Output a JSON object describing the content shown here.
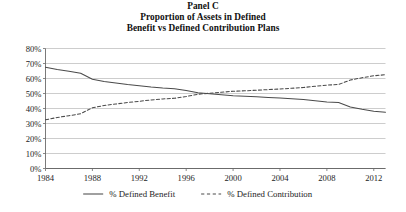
{
  "figure": {
    "panel_label": "Panel C",
    "title_line_1": "Proportion of Assets in Defined",
    "title_line_2": "Benefit vs Defined Contribution Plans"
  },
  "colors": {
    "line": "#4a4a4a",
    "grid": "#b8b8b8",
    "axis": "#6b6b6b",
    "text": "#1a1a1a",
    "background": "#ffffff"
  },
  "legend": {
    "position": "bottom",
    "entries": [
      {
        "label": "% Defined Benefit",
        "style": "solid"
      },
      {
        "label": "% Defined Contribution",
        "style": "dashed"
      }
    ]
  },
  "axes": {
    "y_ticks": [
      "0%",
      "10%",
      "20%",
      "30%",
      "40%",
      "50%",
      "60%",
      "70%",
      "80%"
    ],
    "x_ticks": [
      "1984",
      "1988",
      "1992",
      "1996",
      "2000",
      "2004",
      "2008",
      "2012"
    ]
  },
  "chart_data": {
    "type": "line",
    "xlabel": "",
    "ylabel": "",
    "xlim": [
      1984,
      2013
    ],
    "ylim": [
      0,
      80
    ],
    "grid": true,
    "legend_position": "bottom",
    "x": [
      1984,
      1985,
      1986,
      1987,
      1988,
      1989,
      1990,
      1991,
      1992,
      1993,
      1994,
      1995,
      1996,
      1997,
      1998,
      1999,
      2000,
      2001,
      2002,
      2003,
      2004,
      2005,
      2006,
      2007,
      2008,
      2009,
      2010,
      2011,
      2012,
      2013
    ],
    "series": [
      {
        "name": "% Defined Benefit",
        "style": "solid",
        "values": [
          67.5,
          66.0,
          64.8,
          63.5,
          59.5,
          58.0,
          57.0,
          56.0,
          55.2,
          54.3,
          53.6,
          53.2,
          52.0,
          50.5,
          49.8,
          49.2,
          48.5,
          48.2,
          47.8,
          47.4,
          47.0,
          46.5,
          46.0,
          45.2,
          44.4,
          44.0,
          41.0,
          39.5,
          38.2,
          37.5
        ]
      },
      {
        "name": "% Defined Contribution",
        "style": "dashed",
        "values": [
          32.5,
          34.0,
          35.2,
          36.5,
          40.5,
          42.0,
          43.0,
          44.0,
          44.8,
          45.7,
          46.4,
          46.8,
          48.0,
          49.5,
          50.2,
          50.8,
          51.5,
          51.8,
          52.2,
          52.6,
          53.0,
          53.5,
          54.0,
          54.8,
          55.6,
          56.0,
          59.0,
          60.5,
          61.8,
          62.5
        ]
      }
    ]
  }
}
